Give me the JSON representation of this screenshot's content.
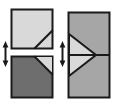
{
  "figure": {
    "title": "",
    "background_color": "#ffffff",
    "width": 118,
    "height": 108,
    "colors": {
      "outline": "#1a1a1a",
      "light_fill": "#d9d9d9",
      "mid_fill": "#a6a6a6",
      "dark_fill": "#6e6e6e",
      "arrow": "#1a1a1a",
      "background": "#ffffff"
    },
    "panels": [
      {
        "id": "left-panel",
        "name": "split-squares-panel",
        "label": "",
        "shapes": [
          {
            "id": "top-square",
            "name": "top-light-square",
            "fill": "#d9d9d9",
            "x": 11,
            "y": 9,
            "width": 42,
            "height": 40,
            "feature": "diagonal-corner-line-lower-right"
          },
          {
            "id": "bottom-square",
            "name": "bottom-dark-square",
            "fill": "#6e6e6e",
            "x": 11,
            "y": 56,
            "width": 42,
            "height": 42,
            "feature": "light-triangle-upper-right"
          }
        ],
        "arrow": {
          "id": "left-arrow",
          "name": "vertical-double-arrow",
          "direction": "vertical-double",
          "x": 5,
          "y_top": 42,
          "y_bottom": 66
        }
      },
      {
        "id": "right-panel",
        "name": "merged-rectangle-panel",
        "label": "",
        "shapes": [
          {
            "id": "tall-rect",
            "name": "tall-mid-rectangle",
            "fill": "#a6a6a6",
            "x": 68,
            "y": 12,
            "width": 42,
            "height": 86,
            "feature": "horizontal-midline-and-right-pointing-triangle"
          },
          {
            "id": "inner-triangle",
            "name": "right-pointing-light-triangle",
            "fill": "#d9d9d9",
            "apex_x": 96,
            "apex_y": 55,
            "base_x": 68,
            "base_top_y": 34,
            "base_bottom_y": 76
          }
        ],
        "arrow": {
          "id": "right-arrow",
          "name": "vertical-double-arrow",
          "direction": "vertical-double",
          "x": 62,
          "y_top": 42,
          "y_bottom": 66
        }
      }
    ]
  }
}
